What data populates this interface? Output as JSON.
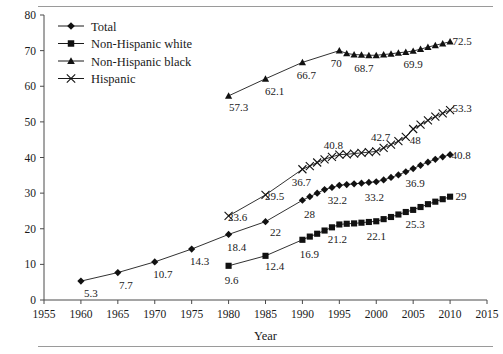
{
  "figure": {
    "x_axis_title": "Year",
    "y_axis_title": ""
  },
  "legend": {
    "items": [
      {
        "label": "Total",
        "marker": "diamond"
      },
      {
        "label": "Non-Hispanic white",
        "marker": "square"
      },
      {
        "label": "Non-Hispanic black",
        "marker": "triangle"
      },
      {
        "label": "Hispanic",
        "marker": "x"
      }
    ]
  },
  "chart_data": {
    "type": "line",
    "title": "",
    "xlabel": "Year",
    "ylabel": "",
    "xlim": [
      1955,
      2015
    ],
    "ylim": [
      0,
      80
    ],
    "xticks": [
      1955,
      1960,
      1965,
      1970,
      1975,
      1980,
      1985,
      1990,
      1995,
      2000,
      2005,
      2010,
      2015
    ],
    "yticks": [
      0,
      10,
      20,
      30,
      40,
      50,
      60,
      70,
      80
    ],
    "grid": false,
    "legend_position": "top-left",
    "series": [
      {
        "name": "Total",
        "marker": "diamond",
        "x": [
          1960,
          1965,
          1970,
          1975,
          1980,
          1985,
          1990,
          1991,
          1992,
          1993,
          1994,
          1995,
          1996,
          1997,
          1998,
          1999,
          2000,
          2001,
          2002,
          2003,
          2004,
          2005,
          2006,
          2007,
          2008,
          2009,
          2010
        ],
        "y": [
          5.3,
          7.7,
          10.7,
          14.3,
          18.4,
          22.0,
          28.0,
          29.0,
          30.0,
          31.0,
          31.6,
          32.2,
          32.4,
          32.6,
          32.8,
          33.0,
          33.2,
          33.7,
          34.4,
          35.1,
          36.0,
          36.9,
          37.8,
          38.7,
          39.5,
          40.2,
          40.8
        ],
        "labels": [
          {
            "x": 1960,
            "text": "5.3"
          },
          {
            "x": 1965,
            "text": "7.7"
          },
          {
            "x": 1970,
            "text": "10.7"
          },
          {
            "x": 1975,
            "text": "14.3"
          },
          {
            "x": 1980,
            "text": "18.4"
          },
          {
            "x": 1985,
            "text": "22"
          },
          {
            "x": 1990,
            "text": "28"
          },
          {
            "x": 1995,
            "text": "32.2"
          },
          {
            "x": 2000,
            "text": "33.2"
          },
          {
            "x": 2005,
            "text": "36.9"
          },
          {
            "x": 2010,
            "text": "40.8"
          }
        ]
      },
      {
        "name": "Non-Hispanic white",
        "marker": "square",
        "x": [
          1980,
          1985,
          1990,
          1991,
          1992,
          1993,
          1994,
          1995,
          1996,
          1997,
          1998,
          1999,
          2000,
          2001,
          2002,
          2003,
          2004,
          2005,
          2006,
          2007,
          2008,
          2009,
          2010
        ],
        "y": [
          9.6,
          12.4,
          16.9,
          17.8,
          18.6,
          19.5,
          20.4,
          21.2,
          21.4,
          21.5,
          21.7,
          21.9,
          22.1,
          22.7,
          23.3,
          24.0,
          24.7,
          25.3,
          26.1,
          26.9,
          27.6,
          28.3,
          29.0
        ],
        "labels": [
          {
            "x": 1980,
            "text": "9.6"
          },
          {
            "x": 1985,
            "text": "12.4"
          },
          {
            "x": 1990,
            "text": "16.9"
          },
          {
            "x": 1995,
            "text": "21.2"
          },
          {
            "x": 2000,
            "text": "22.1"
          },
          {
            "x": 2005,
            "text": "25.3"
          },
          {
            "x": 2010,
            "text": "29"
          }
        ]
      },
      {
        "name": "Non-Hispanic black",
        "marker": "triangle",
        "x": [
          1980,
          1985,
          1990,
          1995,
          1996,
          1997,
          1998,
          1999,
          2000,
          2001,
          2002,
          2003,
          2004,
          2005,
          2006,
          2007,
          2008,
          2009,
          2010
        ],
        "y": [
          57.3,
          62.1,
          66.7,
          70.0,
          69.2,
          68.9,
          68.8,
          68.7,
          68.7,
          68.9,
          69.1,
          69.4,
          69.6,
          69.9,
          70.4,
          71.0,
          71.5,
          72.0,
          72.5
        ],
        "labels": [
          {
            "x": 1980,
            "text": "57.3"
          },
          {
            "x": 1985,
            "text": "62.1"
          },
          {
            "x": 1990,
            "text": "66.7"
          },
          {
            "x": 1995,
            "text": "70"
          },
          {
            "x": 1999,
            "text": "68.7"
          },
          {
            "x": 2005,
            "text": "69.9"
          },
          {
            "x": 2010,
            "text": "72.5"
          }
        ]
      },
      {
        "name": "Hispanic",
        "marker": "x",
        "x": [
          1980,
          1985,
          1990,
          1991,
          1992,
          1993,
          1994,
          1995,
          1996,
          1997,
          1998,
          1999,
          2000,
          2001,
          2002,
          2003,
          2004,
          2005,
          2006,
          2007,
          2008,
          2009,
          2010
        ],
        "y": [
          23.6,
          29.5,
          36.7,
          37.6,
          38.6,
          39.5,
          40.2,
          40.8,
          40.9,
          41.1,
          41.3,
          41.5,
          41.7,
          42.7,
          43.6,
          44.6,
          45.8,
          48.0,
          49.2,
          50.4,
          51.5,
          52.4,
          53.3
        ],
        "labels": [
          {
            "x": 1980,
            "text": "23.6"
          },
          {
            "x": 1985,
            "text": "29.5"
          },
          {
            "x": 1990,
            "text": "36.7"
          },
          {
            "x": 1995,
            "text": "40.8"
          },
          {
            "x": 2001,
            "text": "42.7"
          },
          {
            "x": 2005,
            "text": "48"
          },
          {
            "x": 2010,
            "text": "53.3"
          }
        ]
      }
    ]
  },
  "label_offsets": {
    "Total": {
      "5.3": [
        10,
        16
      ],
      "7.7": [
        8,
        16
      ],
      "10.7": [
        8,
        16
      ],
      "14.3": [
        8,
        16
      ],
      "18.4": [
        8,
        17
      ],
      "22": [
        10,
        14
      ],
      "28": [
        7,
        18
      ],
      "32.2": [
        -2,
        19
      ],
      "33.2": [
        -2,
        19
      ],
      "36.9": [
        2,
        18
      ],
      "40.8": [
        11,
        4
      ]
    },
    "Non-Hispanic white": {
      "9.6": [
        3,
        18
      ],
      "12.4": [
        9,
        14
      ],
      "16.9": [
        7,
        18
      ],
      "21.2": [
        -2,
        19
      ],
      "22.1": [
        0,
        19
      ],
      "25.3": [
        2,
        18
      ],
      "29": [
        11,
        3
      ]
    },
    "Non-Hispanic black": {
      "57.3": [
        10,
        15
      ],
      "62.1": [
        9,
        16
      ],
      "66.7": [
        4,
        17
      ],
      "70": [
        -3,
        16
      ],
      "68.7": [
        -5,
        17
      ],
      "69.9": [
        0,
        17
      ],
      "72.5": [
        12,
        3
      ]
    },
    "Hispanic": {
      "23.6": [
        9,
        5
      ],
      "29.5": [
        9,
        5
      ],
      "36.7": [
        -1,
        17
      ],
      "40.8": [
        -6,
        -6
      ],
      "42.7": [
        -3,
        -7
      ],
      "48": [
        2,
        15
      ],
      "53.3": [
        12,
        2
      ]
    }
  }
}
